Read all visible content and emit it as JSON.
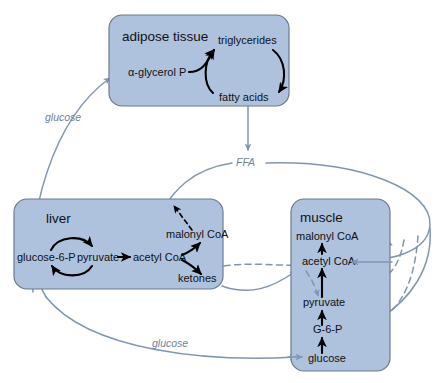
{
  "diagram": {
    "colors": {
      "box_fill": "#aec2de",
      "box_stroke": "#6b7a8d",
      "flow_arrow": "#7f95b5",
      "reaction_arrow": "#000000",
      "transport_label": "#6f819c",
      "background": "#ffffff"
    }
  },
  "tissues": {
    "adipose": {
      "title": "adipose tissue",
      "metabolites": {
        "glycerol_p": "α-glycerol P",
        "triglycerides": "triglycerides",
        "fatty_acids": "fatty acids"
      }
    },
    "liver": {
      "title": "liver",
      "metabolites": {
        "glucose_6_p": "glucose-6-P",
        "pyruvate": "pyruvate",
        "acetyl_coa": "acetyl CoA",
        "malonyl_coa": "malonyl CoA",
        "ketones": "ketones"
      }
    },
    "muscle": {
      "title": "muscle",
      "metabolites": {
        "malonyl_coa": "malonyl CoA",
        "acetyl_coa": "acetyl CoA",
        "pyruvate": "pyruvate",
        "g_6_p": "G-6-P",
        "glucose": "glucose"
      }
    }
  },
  "transport_labels": {
    "glucose_to_adipose": "glucose",
    "ffa": "FFA",
    "glucose_to_muscle": "glucose"
  }
}
